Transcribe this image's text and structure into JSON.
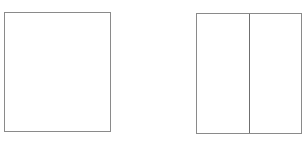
{
  "diagram": {
    "shapes": [
      {
        "id": "single-frame",
        "type": "rectangle",
        "panels": 1,
        "stroke": "#8a8a8a",
        "fill": "#ffffff"
      },
      {
        "id": "split-frame",
        "type": "rectangle",
        "panels": 2,
        "divider": "vertical",
        "stroke": "#8a8a8a",
        "fill": "#ffffff"
      }
    ]
  }
}
